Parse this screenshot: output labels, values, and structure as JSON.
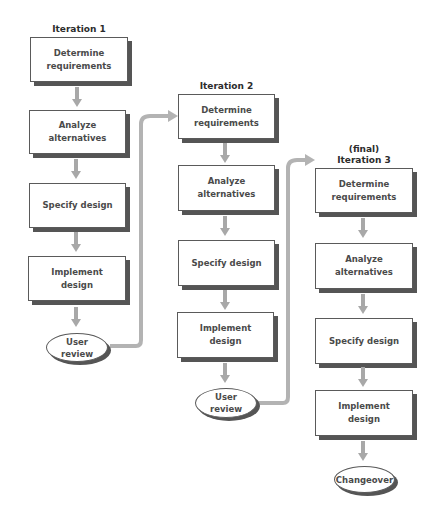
{
  "diagram": {
    "type": "iterative-development-flowchart",
    "colors": {
      "box_border": "#5a5a5a",
      "box_shadow": "#555555",
      "text": "#4a4a4a",
      "arrow": "#a8a8a8",
      "connector": "#b0b0b0"
    },
    "iterations": [
      {
        "title_prefix": "",
        "title": "Iteration 1",
        "steps": [
          "Determine\nrequirements",
          "Analyze\nalternatives",
          "Specify design",
          "Implement\ndesign"
        ],
        "end": "User\nreview"
      },
      {
        "title_prefix": "",
        "title": "Iteration 2",
        "steps": [
          "Determine\nrequirements",
          "Analyze\nalternatives",
          "Specify design",
          "Implement\ndesign"
        ],
        "end": "User\nreview"
      },
      {
        "title_prefix": "(final)",
        "title": "Iteration 3",
        "steps": [
          "Determine\nrequirements",
          "Analyze\nalternatives",
          "Specify design",
          "Implement\ndesign"
        ],
        "end": "Changeover"
      }
    ]
  }
}
